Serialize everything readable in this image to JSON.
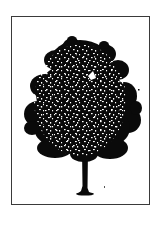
{
  "image": {
    "subject": "tree-illustration",
    "style": "black-and-white stipple silhouette",
    "frame": {
      "border_color": "#3a3a3a",
      "background": "#ffffff"
    },
    "colors": {
      "ink": "#0a0a0a",
      "paper": "#ffffff"
    }
  }
}
